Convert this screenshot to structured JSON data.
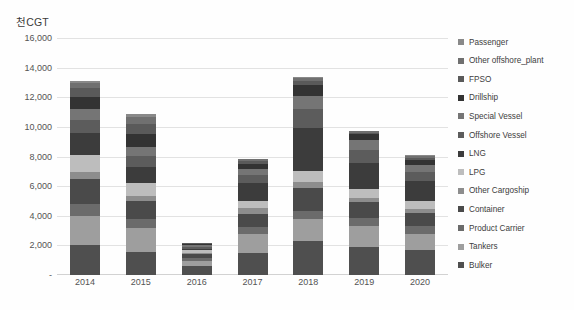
{
  "chart_data": {
    "type": "bar",
    "subtype": "stacked-bar",
    "title": "",
    "xlabel": "",
    "ylabel": "천CGT",
    "ylim": [
      0,
      16000
    ],
    "ytick_labels": [
      "16,000",
      "14,000",
      "12,000",
      "10,000",
      "8,000",
      "6,000",
      "4,000",
      "2,000",
      "-"
    ],
    "ytick_values": [
      16000,
      14000,
      12000,
      10000,
      8000,
      6000,
      4000,
      2000,
      0
    ],
    "grid": true,
    "legend_position": "right",
    "categories": [
      "2014",
      "2015",
      "2016",
      "2017",
      "2018",
      "2019",
      "2020"
    ],
    "series": [
      {
        "name": "Bulker",
        "color": "#4f4f4f",
        "values": [
          2050,
          1550,
          620,
          1500,
          2300,
          1900,
          1700
        ]
      },
      {
        "name": "Tankers",
        "color": "#9e9e9e",
        "values": [
          1950,
          1600,
          350,
          1250,
          1450,
          1400,
          1100
        ]
      },
      {
        "name": "Product Carrier",
        "color": "#6b6b6b",
        "values": [
          800,
          600,
          150,
          500,
          600,
          550,
          500
        ]
      },
      {
        "name": "Container",
        "color": "#4a4a4a",
        "values": [
          1700,
          1250,
          280,
          900,
          1500,
          1050,
          900
        ]
      },
      {
        "name": "Other Cargoship",
        "color": "#8d8d8d",
        "values": [
          450,
          350,
          120,
          350,
          400,
          300,
          280
        ]
      },
      {
        "name": "LPG",
        "color": "#bdbdbd",
        "values": [
          1150,
          850,
          180,
          500,
          800,
          600,
          520
        ]
      },
      {
        "name": "LNG",
        "color": "#3c3c3c",
        "values": [
          1500,
          1100,
          90,
          1200,
          2900,
          1750,
          1350
        ]
      },
      {
        "name": "Offshore Vessel",
        "color": "#5c5c5c",
        "values": [
          900,
          750,
          130,
          550,
          1250,
          900,
          620
        ]
      },
      {
        "name": "Special Vessel",
        "color": "#757575",
        "values": [
          700,
          600,
          110,
          420,
          900,
          650,
          450
        ]
      },
      {
        "name": "Drillship",
        "color": "#333333",
        "values": [
          850,
          900,
          80,
          350,
          700,
          400,
          350
        ]
      },
      {
        "name": "FPSO",
        "color": "#5a5a5a",
        "values": [
          550,
          620,
          50,
          180,
          300,
          120,
          150
        ]
      },
      {
        "name": "Other offshore_plant",
        "color": "#707070",
        "values": [
          350,
          530,
          30,
          120,
          200,
          90,
          110
        ]
      },
      {
        "name": "Passenger",
        "color": "#898989",
        "values": [
          150,
          200,
          10,
          30,
          50,
          40,
          70
        ]
      }
    ],
    "totals": [
      13100,
      10900,
      2200,
      7850,
      13350,
      9750,
      8100
    ]
  },
  "axis": {
    "y_title": "천CGT"
  }
}
